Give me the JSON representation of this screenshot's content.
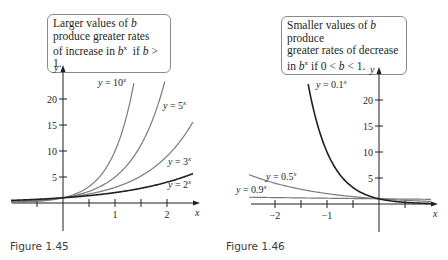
{
  "figures": [
    {
      "caption": "Figure 1.45",
      "callout": {
        "line1": "Larger values of b",
        "line2": "produce greater rates",
        "line3": "of increase in b^x if b > 1."
      },
      "axes": {
        "x_label": "x",
        "y_label": "y",
        "x_ticks": [
          "1",
          "2"
        ],
        "y_ticks": [
          "5",
          "10",
          "15",
          "20"
        ]
      },
      "curve_labels": [
        "y = 10^x",
        "y = 5^x",
        "y = 3^x",
        "y = 2^x"
      ]
    },
    {
      "caption": "Figure 1.46",
      "callout": {
        "line1": "Smaller values of b produce",
        "line2": "greater rates of decrease",
        "line3": "in b^x if 0 < b < 1."
      },
      "axes": {
        "x_label": "x",
        "y_label": "y",
        "x_ticks": [
          "−2",
          "−1"
        ],
        "y_ticks": [
          "5",
          "10",
          "15",
          "20"
        ]
      },
      "curve_labels": [
        "y = 0.1^x",
        "y = 0.5^x",
        "y = 0.9^x"
      ]
    }
  ],
  "chart_data": [
    {
      "type": "line",
      "title": "Figure 1.45",
      "annotation": "Larger values of b produce greater rates of increase in b^x if b > 1.",
      "xlabel": "x",
      "ylabel": "y",
      "xlim": [
        -1.0,
        2.5
      ],
      "ylim": [
        0,
        23
      ],
      "x_ticks": [
        1,
        2
      ],
      "x_minor_ticks": [
        -0.5,
        0.5,
        1.5
      ],
      "y_ticks": [
        5,
        10,
        15,
        20
      ],
      "grid": false,
      "series": [
        {
          "name": "y = 10^x",
          "base": 10,
          "color": "#7a7a7a"
        },
        {
          "name": "y = 5^x",
          "base": 5,
          "color": "#7a7a7a"
        },
        {
          "name": "y = 3^x",
          "base": 3,
          "color": "#7a7a7a"
        },
        {
          "name": "y = 2^x",
          "base": 2,
          "color": "#231f20"
        }
      ]
    },
    {
      "type": "line",
      "title": "Figure 1.46",
      "annotation": "Smaller values of b produce greater rates of decrease in b^x if 0 < b < 1.",
      "xlabel": "x",
      "ylabel": "y",
      "xlim": [
        -2.5,
        1.0
      ],
      "ylim": [
        0,
        23
      ],
      "x_ticks": [
        -2,
        -1
      ],
      "x_minor_ticks": [
        -1.5,
        -0.5,
        0.5
      ],
      "y_ticks": [
        5,
        10,
        15,
        20
      ],
      "grid": false,
      "series": [
        {
          "name": "y = 0.1^x",
          "base": 0.1,
          "color": "#231f20"
        },
        {
          "name": "y = 0.5^x",
          "base": 0.5,
          "color": "#7a7a7a"
        },
        {
          "name": "y = 0.9^x",
          "base": 0.9,
          "color": "#7a7a7a"
        }
      ]
    }
  ]
}
